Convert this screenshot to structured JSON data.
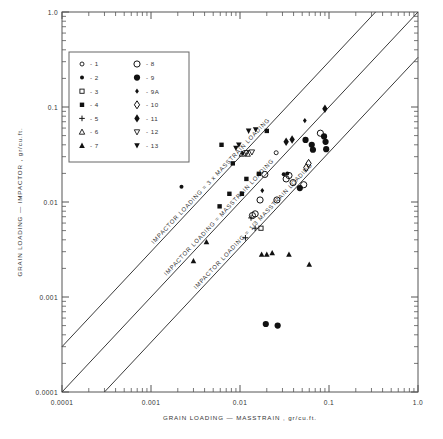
{
  "chart_data": {
    "type": "scatter",
    "title": "",
    "xlabel": "GRAIN LOADING — MASSTRAIN , gr/cu.ft.",
    "ylabel": "GRAIN LOADING — IMPACTOR , gr/cu.ft.",
    "xscale": "log",
    "yscale": "log",
    "xlim": [
      0.0001,
      1.0
    ],
    "ylim": [
      0.0001,
      1.0
    ],
    "grid": false,
    "xticklabels": [
      "0.0001",
      "0.001",
      "0.01",
      "0.1",
      "1.0"
    ],
    "yticklabels": [
      "0.0001",
      "0.001",
      "0.01",
      "0.1",
      "1.0"
    ],
    "xtickvalues": [
      0.0001,
      0.001,
      0.01,
      0.1,
      1.0
    ],
    "ytickvalues": [
      0.0001,
      0.001,
      0.01,
      0.1,
      1.0
    ],
    "legend_position": "upper-left inside",
    "reference_lines": [
      {
        "name": "upper",
        "label": "IMPACTOR LOADING = 3 x MASSTRAIN LOADING",
        "slope": 1,
        "ratio": 3
      },
      {
        "name": "middle",
        "label": "IMPACTOR LOADING = MASSTRAIN LOADING",
        "slope": 1,
        "ratio": 1
      },
      {
        "name": "lower",
        "label": "IMPACTOR LOADING = 1/3 MASSTRAIN LOADING",
        "slope": 1,
        "ratio": 0.3333
      }
    ],
    "legend": {
      "columns": 2,
      "left": [
        {
          "key": "1",
          "label": "1",
          "marker": "open-circle-small"
        },
        {
          "key": "2",
          "label": "2",
          "marker": "filled-circle-small"
        },
        {
          "key": "3",
          "label": "3",
          "marker": "open-square-small"
        },
        {
          "key": "4",
          "label": "4",
          "marker": "filled-square-small"
        },
        {
          "key": "5",
          "label": "5",
          "marker": "plus"
        },
        {
          "key": "6",
          "label": "6",
          "marker": "open-triangle-up"
        },
        {
          "key": "7",
          "label": "7",
          "marker": "filled-triangle-up"
        }
      ],
      "right": [
        {
          "key": "8",
          "label": "8",
          "marker": "open-circle-large"
        },
        {
          "key": "9",
          "label": "9",
          "marker": "filled-circle-large"
        },
        {
          "key": "9A",
          "label": "9A",
          "marker": "filled-diamond-small"
        },
        {
          "key": "10",
          "label": "10",
          "marker": "open-diamond"
        },
        {
          "key": "11",
          "label": "11",
          "marker": "filled-diamond"
        },
        {
          "key": "12",
          "label": "12",
          "marker": "open-triangle-down"
        },
        {
          "key": "13",
          "label": "13",
          "marker": "filled-triangle-down"
        }
      ]
    },
    "points": [
      {
        "x": 0.0022,
        "y": 0.0145,
        "marker": "filled-circle-small"
      },
      {
        "x": 0.0195,
        "y": 0.00052,
        "marker": "filled-circle-large"
      },
      {
        "x": 0.0265,
        "y": 0.0005,
        "marker": "filled-circle-large"
      },
      {
        "x": 0.0062,
        "y": 0.04,
        "marker": "filled-square-small"
      },
      {
        "x": 0.0083,
        "y": 0.0255,
        "marker": "filled-square-small"
      },
      {
        "x": 0.0076,
        "y": 0.0122,
        "marker": "filled-square-small"
      },
      {
        "x": 0.0059,
        "y": 0.009,
        "marker": "filled-square-small"
      },
      {
        "x": 0.02,
        "y": 0.056,
        "marker": "filled-square-small"
      },
      {
        "x": 0.0163,
        "y": 0.0198,
        "marker": "filled-square-small"
      },
      {
        "x": 0.0118,
        "y": 0.0175,
        "marker": "filled-square-small"
      },
      {
        "x": 0.0105,
        "y": 0.0122,
        "marker": "filled-square-small"
      },
      {
        "x": 0.0097,
        "y": 0.04,
        "marker": "filled-triangle-down"
      },
      {
        "x": 0.0125,
        "y": 0.056,
        "marker": "filled-triangle-down"
      },
      {
        "x": 0.015,
        "y": 0.058,
        "marker": "filled-triangle-down"
      },
      {
        "x": 0.009,
        "y": 0.037,
        "marker": "filled-triangle-down"
      },
      {
        "x": 0.0118,
        "y": 0.033,
        "marker": "open-triangle-down"
      },
      {
        "x": 0.0136,
        "y": 0.0335,
        "marker": "open-triangle-down"
      },
      {
        "x": 0.0105,
        "y": 0.032,
        "marker": "open-triangle-up"
      },
      {
        "x": 0.0122,
        "y": 0.032,
        "marker": "open-triangle-up"
      },
      {
        "x": 0.019,
        "y": 0.0195,
        "marker": "open-circle-large"
      },
      {
        "x": 0.0168,
        "y": 0.0105,
        "marker": "open-circle-large"
      },
      {
        "x": 0.026,
        "y": 0.0105,
        "marker": "open-circle-large"
      },
      {
        "x": 0.0355,
        "y": 0.019,
        "marker": "open-circle-large"
      },
      {
        "x": 0.033,
        "y": 0.0175,
        "marker": "open-circle-large"
      },
      {
        "x": 0.0395,
        "y": 0.016,
        "marker": "open-circle-large"
      },
      {
        "x": 0.052,
        "y": 0.0152,
        "marker": "open-circle-large"
      },
      {
        "x": 0.08,
        "y": 0.053,
        "marker": "open-circle-large"
      },
      {
        "x": 0.0148,
        "y": 0.0075,
        "marker": "open-circle-large"
      },
      {
        "x": 0.0138,
        "y": 0.0072,
        "marker": "open-circle-large"
      },
      {
        "x": 0.047,
        "y": 0.014,
        "marker": "filled-circle-large"
      },
      {
        "x": 0.0545,
        "y": 0.045,
        "marker": "filled-circle-large"
      },
      {
        "x": 0.064,
        "y": 0.04,
        "marker": "filled-circle-large"
      },
      {
        "x": 0.066,
        "y": 0.0355,
        "marker": "filled-circle-large"
      },
      {
        "x": 0.088,
        "y": 0.049,
        "marker": "filled-circle-large"
      },
      {
        "x": 0.0915,
        "y": 0.043,
        "marker": "filled-circle-large"
      },
      {
        "x": 0.093,
        "y": 0.036,
        "marker": "filled-circle-large"
      },
      {
        "x": 0.034,
        "y": 0.02,
        "marker": "filled-circle-small"
      },
      {
        "x": 0.031,
        "y": 0.0196,
        "marker": "filled-circle-small"
      },
      {
        "x": 0.033,
        "y": 0.043,
        "marker": "filled-diamond"
      },
      {
        "x": 0.0385,
        "y": 0.0455,
        "marker": "filled-diamond"
      },
      {
        "x": 0.09,
        "y": 0.096,
        "marker": "filled-diamond"
      },
      {
        "x": 0.059,
        "y": 0.0255,
        "marker": "open-diamond"
      },
      {
        "x": 0.0555,
        "y": 0.023,
        "marker": "open-diamond"
      },
      {
        "x": 0.0133,
        "y": 0.0068,
        "marker": "plus"
      },
      {
        "x": 0.0148,
        "y": 0.0053,
        "marker": "plus"
      },
      {
        "x": 0.0115,
        "y": 0.0042,
        "marker": "plus"
      },
      {
        "x": 0.0172,
        "y": 0.0053,
        "marker": "open-square-small"
      },
      {
        "x": 0.0042,
        "y": 0.0038,
        "marker": "filled-triangle-up"
      },
      {
        "x": 0.003,
        "y": 0.0024,
        "marker": "filled-triangle-up"
      },
      {
        "x": 0.02,
        "y": 0.0028,
        "marker": "filled-triangle-up"
      },
      {
        "x": 0.023,
        "y": 0.0029,
        "marker": "filled-triangle-up"
      },
      {
        "x": 0.0175,
        "y": 0.0028,
        "marker": "filled-triangle-up"
      },
      {
        "x": 0.0355,
        "y": 0.0028,
        "marker": "filled-triangle-up"
      },
      {
        "x": 0.06,
        "y": 0.0022,
        "marker": "filled-triangle-up"
      },
      {
        "x": 0.0107,
        "y": 0.0325,
        "marker": "filled-diamond-small"
      },
      {
        "x": 0.0178,
        "y": 0.0132,
        "marker": "filled-diamond-small"
      },
      {
        "x": 0.0535,
        "y": 0.072,
        "marker": "filled-diamond-small"
      },
      {
        "x": 0.0255,
        "y": 0.033,
        "marker": "open-circle-small"
      }
    ]
  }
}
